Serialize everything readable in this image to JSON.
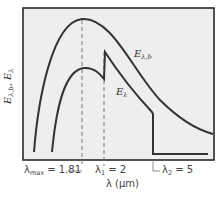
{
  "figure": {
    "y_axis_label": "Eλ,b, Eλ",
    "y_axis_label_parts": {
      "a": "E",
      "a_sub": "λ,b",
      "sep": ", ",
      "b": "E",
      "b_sub": "λ"
    },
    "x_axis_label": "λ (μm)",
    "curves": [
      {
        "name": "Eλ,b",
        "label_main": "E",
        "label_sub": "λ,b",
        "description": "blackbody spectral emissive power"
      },
      {
        "name": "Eλ",
        "label_main": "E",
        "label_sub": "λ",
        "description": "actual spectral emissive power"
      }
    ],
    "markers": [
      {
        "symbol": "λ",
        "sub": "max",
        "eq": " = 1.81",
        "value": 1.81
      },
      {
        "symbol": "λ",
        "sub": "1",
        "eq": " = 2",
        "value": 2
      },
      {
        "symbol": "λ",
        "sub": "2",
        "eq": " = 5",
        "value": 5
      }
    ],
    "colors": {
      "plot_background": "#eeeeee",
      "frame": "#2a2a2a",
      "curve": "#333333",
      "dashed": "#777777"
    }
  }
}
